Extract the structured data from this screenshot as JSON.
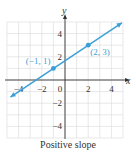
{
  "chart_data": {
    "type": "line",
    "title": "",
    "caption": "Positive slope",
    "xlabel": "x",
    "ylabel": "y",
    "xlim": [
      -5,
      5
    ],
    "ylim": [
      -5,
      5
    ],
    "grid": true,
    "grid_step": 1,
    "x_ticks": [
      -4,
      -2,
      0,
      2,
      4
    ],
    "y_ticks": [
      -4,
      -2,
      2,
      4
    ],
    "series": [
      {
        "name": "line",
        "slope": 0.6667,
        "intercept": 1.6667,
        "x": [
          -4.7,
          4.9
        ],
        "y": [
          -1.47,
          4.93
        ],
        "color": "#3a9fd6",
        "arrows": "both"
      }
    ],
    "points": [
      {
        "x": -1,
        "y": 1,
        "label": "(−1, 1)"
      },
      {
        "x": 2,
        "y": 3,
        "label": "(2, 3)"
      }
    ]
  },
  "colors": {
    "line": "#3a9fd6",
    "grid": "#d9d9d9",
    "axis": "#333333"
  }
}
